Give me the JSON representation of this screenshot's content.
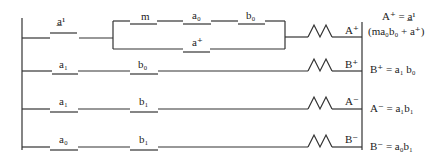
{
  "rungs": [
    {
      "contacts": [
        "a^1",
        "m",
        "a_0",
        "b_0"
      ],
      "parallel": [
        "a^+"
      ],
      "coil": "A+",
      "equation_line1": "A⁺ = a̲¹",
      "equation_line2": "(ma₀b₀ + a⁺)"
    },
    {
      "contacts": [
        "a_1",
        "b_0"
      ],
      "coil": "B+",
      "equation_line1": "B⁺ = a₁ b₀"
    },
    {
      "contacts": [
        "a_1",
        "b_1"
      ],
      "coil": "A-",
      "equation_line1": "A⁻ = a₁b₁"
    },
    {
      "contacts": [
        "a_0",
        "b_1"
      ],
      "coil": "B-",
      "equation_line1": "B⁻ = a₀b₁"
    }
  ],
  "labels": {
    "r1c1": "a̲¹",
    "r1c2": "m",
    "r1c3": "a₀",
    "r1c4": "b₀",
    "r1p": "a⁺",
    "r1coil": "A⁺",
    "r2c1": "a₁",
    "r2c2": "b₀",
    "r2coil": "B⁺",
    "r3c1": "a₁",
    "r3c2": "b₁",
    "r3coil": "A⁻",
    "r4c1": "a₀",
    "r4c2": "b₁",
    "r4coil": "B⁻"
  },
  "equations": {
    "e1a": "A⁺ = a̲¹",
    "e1b": "(ma₀b₀ + a⁺)",
    "e2": "B⁺ = a₁ b₀",
    "e3": "A⁻ = a₁b₁",
    "e4": "B⁻ = a₀b₁"
  }
}
